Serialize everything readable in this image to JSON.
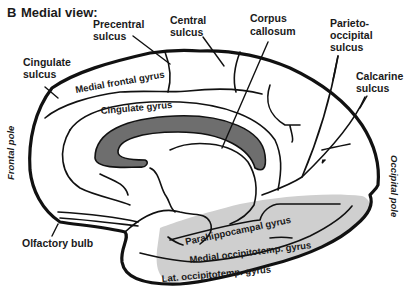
{
  "figure": {
    "panel_letter": "B",
    "title": "Medial view:",
    "colors": {
      "corpus_callosum_fill": "#6e6e6e",
      "temporal_region_fill": "#cfcfcf",
      "outline": "#111111",
      "text": "#1a1a1a",
      "background": "#ffffff"
    },
    "labels": {
      "precentral_sulcus": [
        "Precentral",
        "sulcus"
      ],
      "central_sulcus": [
        "Central",
        "sulcus"
      ],
      "corpus_callosum": [
        "Corpus",
        "callosum"
      ],
      "parieto_occipital_sulcus": [
        "Parieto-",
        "occipital",
        "sulcus"
      ],
      "cingulate_sulcus": [
        "Cingulate",
        "sulcus"
      ],
      "calcarine_sulcus": [
        "Calcarine",
        "sulcus"
      ],
      "medial_frontal_gyrus": "Medial frontal gyrus",
      "cingulate_gyrus": "Cingulate gyrus",
      "frontal_pole": "Frontal pole",
      "occipital_pole": "Occipital pole",
      "olfactory_bulb": "Olfactory bulb",
      "parahippocampal_gyrus": "Parahippocampal gyrus",
      "medial_occipitotemp_gyrus": "Medial occipitotemp. gyrus",
      "lat_occipitotemp_gyrus": "Lat. occipitotemp. gyrus"
    }
  }
}
